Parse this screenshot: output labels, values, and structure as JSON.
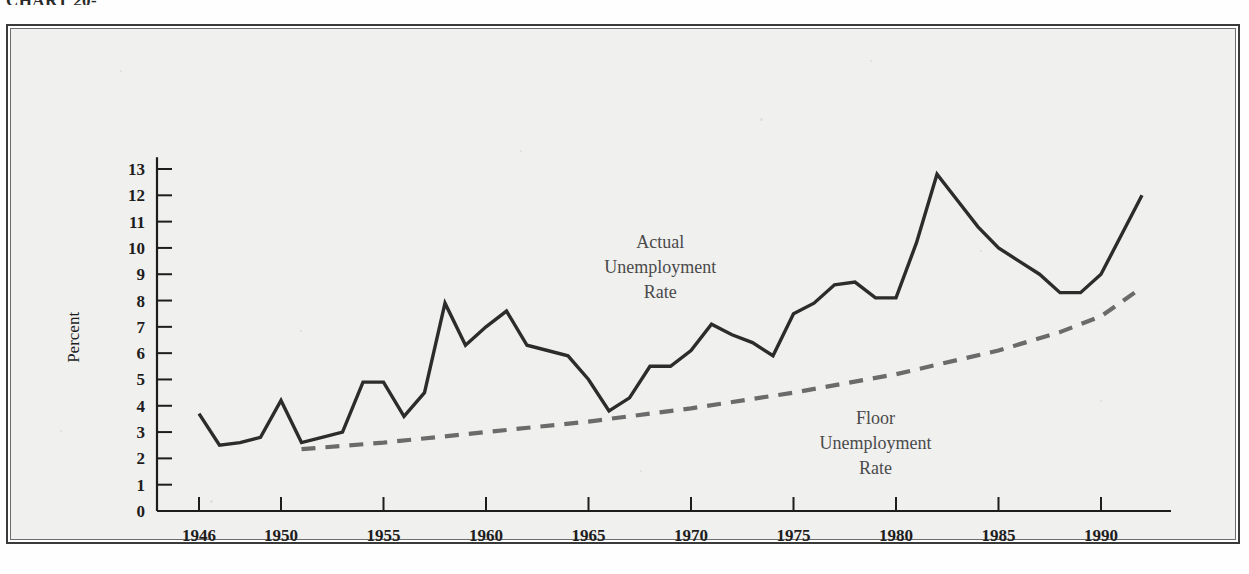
{
  "page": {
    "caption_top": "CHART 20-",
    "background_color": "#f0f0ef",
    "frame_color": "#3a3a3a"
  },
  "chart_data": {
    "type": "line",
    "title": "",
    "subtitle": "",
    "xlabel": "",
    "ylabel": "Percent",
    "xlim": [
      1945,
      1993
    ],
    "ylim": [
      0,
      13.6
    ],
    "grid": false,
    "legend_position": "inline-annotation",
    "y_ticks": [
      0,
      1,
      2,
      3,
      4,
      5,
      6,
      7,
      8,
      9,
      10,
      11,
      12,
      13
    ],
    "y_tick_labels": [
      "0",
      "1",
      "2",
      "3",
      "4",
      "5",
      "6",
      "7",
      "8",
      "9",
      "10",
      "11",
      "12",
      "13"
    ],
    "x_ticks": [
      1946,
      1950,
      1955,
      1960,
      1965,
      1970,
      1975,
      1980,
      1985,
      1990
    ],
    "x_tick_labels": [
      "1946",
      "1950",
      "1955",
      "1960",
      "1965",
      "1970",
      "1975",
      "1980",
      "1985",
      "1990"
    ],
    "annotations": [
      {
        "id": "actual-label",
        "lines": [
          "Actual",
          "Unemployment",
          "Rate"
        ],
        "x": 1968.5,
        "y": 10.0,
        "align": "middle",
        "color": "#4a4a4a"
      },
      {
        "id": "floor-label",
        "lines": [
          "Floor",
          "Unemployment",
          "Rate"
        ],
        "x": 1979.0,
        "y": 3.3,
        "align": "middle",
        "color": "#4a4a4a"
      }
    ],
    "series": [
      {
        "name": "Actual Unemployment Rate",
        "style": "solid",
        "color": "#2c2c2c",
        "width": 3.4,
        "x": [
          1946,
          1947,
          1948,
          1949,
          1950,
          1951,
          1952,
          1953,
          1954,
          1955,
          1956,
          1957,
          1958,
          1959,
          1960,
          1961,
          1962,
          1963,
          1964,
          1965,
          1966,
          1967,
          1968,
          1969,
          1970,
          1971,
          1972,
          1973,
          1974,
          1975,
          1976,
          1977,
          1978,
          1979,
          1980,
          1981,
          1982,
          1983,
          1984,
          1985,
          1986,
          1987,
          1988,
          1989,
          1990,
          1991,
          1992
        ],
        "values": [
          3.7,
          2.5,
          2.6,
          2.8,
          4.2,
          2.6,
          2.8,
          3.0,
          4.9,
          4.9,
          3.6,
          4.5,
          7.9,
          6.3,
          7.0,
          7.6,
          6.3,
          6.1,
          5.9,
          5.0,
          3.8,
          4.3,
          5.5,
          5.5,
          6.1,
          7.1,
          6.7,
          6.4,
          5.9,
          7.5,
          7.9,
          8.6,
          8.7,
          8.1,
          8.1,
          10.2,
          12.8,
          11.8,
          10.8,
          10.0,
          9.5,
          9.0,
          8.3,
          8.3,
          9.0,
          10.5,
          12.0
        ]
      },
      {
        "name": "Floor Unemployment Rate",
        "style": "dashed",
        "color": "#6b6b6b",
        "width": 4.2,
        "x": [
          1951,
          1955,
          1960,
          1965,
          1970,
          1975,
          1980,
          1985,
          1988,
          1990,
          1992
        ],
        "values": [
          2.35,
          2.6,
          3.0,
          3.4,
          3.9,
          4.5,
          5.2,
          6.1,
          6.8,
          7.4,
          8.5
        ]
      }
    ]
  }
}
